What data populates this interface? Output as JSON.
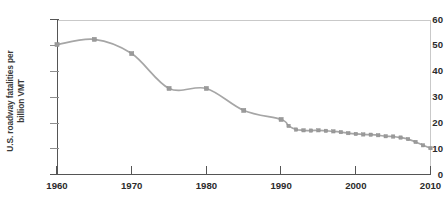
{
  "chart_data": {
    "type": "line",
    "title": "",
    "xlabel": "",
    "ylabel": "U.S. roadway fatalities per billion VMT",
    "ylabel_line1": "U.S. roadway fatalities per",
    "ylabel_line2": "billion VMT",
    "xlim": [
      1960,
      2010
    ],
    "ylim": [
      0,
      60
    ],
    "xticks": [
      1960,
      1970,
      1980,
      1990,
      2000,
      2010
    ],
    "xticklabels": [
      "1960",
      "1970",
      "1980",
      "1990",
      "2000",
      "2010"
    ],
    "yticks": [
      0,
      10,
      20,
      30,
      40,
      50,
      60
    ],
    "yticklabels": [
      "0",
      "10",
      "20",
      "30",
      "40",
      "50",
      "60"
    ],
    "grid": false,
    "legend": false,
    "marker": "square",
    "line_color": "#a6a6a6",
    "marker_color": "#9a9a9a",
    "axis_color": "#555555",
    "background": "#ffffff",
    "x": [
      1960,
      1965,
      1970,
      1975,
      1980,
      1985,
      1990,
      1991,
      1992,
      1993,
      1994,
      1995,
      1996,
      1997,
      1998,
      1999,
      2000,
      2001,
      2002,
      2003,
      2004,
      2005,
      2006,
      2007,
      2008,
      2009,
      2010
    ],
    "values": [
      50.5,
      52.5,
      47.0,
      33.5,
      33.5,
      25.0,
      21.5,
      19.0,
      17.6,
      17.3,
      17.2,
      17.3,
      17.1,
      16.9,
      16.6,
      16.2,
      15.9,
      15.7,
      15.6,
      15.4,
      15.0,
      14.9,
      14.5,
      13.9,
      12.8,
      11.5,
      10.4
    ],
    "annotations": []
  }
}
